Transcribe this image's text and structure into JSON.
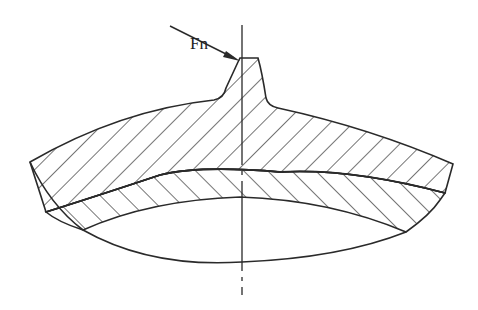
{
  "diagram": {
    "type": "technical cross-section drawing",
    "labels": {
      "force": "Fn"
    },
    "colors": {
      "line": "#2a2a2a",
      "background": "#ffffff"
    },
    "elements": [
      "tooth with hatched cross-section",
      "upper hatched rim layer (hatch rising right)",
      "lower hatched web layer (hatch falling right)",
      "lower unhatched bore arc",
      "dash-dot vertical centerline",
      "force arrow Fn pointing to tooth tip"
    ]
  }
}
